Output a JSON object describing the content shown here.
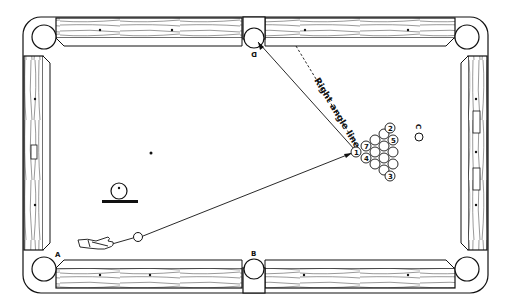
{
  "diagram": {
    "colors": {
      "ink": "#111111",
      "background": "#ffffff",
      "felt": "#ffffff"
    },
    "labels": {
      "pocket_a": "A",
      "pocket_b": "B",
      "pocket_d": "D",
      "spot_c": "C",
      "right_angle_line": "Right angle line"
    },
    "rack": {
      "numbered_balls": [
        {
          "number": "1",
          "x": 356,
          "y": 152
        },
        {
          "number": "7",
          "x": 366,
          "y": 146
        },
        {
          "number": "4",
          "x": 366,
          "y": 158
        },
        {
          "number": "2",
          "x": 389,
          "y": 133
        },
        {
          "number": "5",
          "x": 389,
          "y": 145
        },
        {
          "number": "3",
          "x": 389,
          "y": 171
        }
      ]
    },
    "cue_ball_position": {
      "x": 138,
      "y": 237
    },
    "spots": {
      "head_spot": {
        "x": 151,
        "y": 153
      }
    },
    "legend_ball_icon": "ball-on-rail-icon"
  }
}
